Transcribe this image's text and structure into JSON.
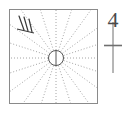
{
  "figure": {
    "canvas": {
      "width": 127,
      "height": 113,
      "background": "#ffffff"
    },
    "colors": {
      "frame": "#8a8a8a",
      "ray": "#9a9a9a",
      "hub": "#555555",
      "hatch": "#3a3a3a",
      "annotation": "#6f6f6f",
      "numeral": "#4a4a4a"
    },
    "frame": {
      "name": "square-border",
      "x": 9.5,
      "y": 9.5,
      "width": 88,
      "height": 94,
      "stroke_width": 1
    },
    "hub": {
      "name": "center-circle",
      "cx": 56,
      "cy": 58,
      "r": 7.5,
      "stroke_width": 1,
      "chord_label": "vertical-diameter",
      "chord": {
        "x1": 56,
        "y1": 50.5,
        "x2": 56,
        "y2": 65.5
      }
    },
    "rays": {
      "name": "radiating-dotted-lines",
      "count": 20,
      "style": "dotted",
      "dash": "1 2",
      "stroke_width": 0.9,
      "angles_deg": [
        0,
        18,
        36,
        54,
        72,
        90,
        108,
        126,
        144,
        162,
        180,
        198,
        216,
        234,
        252,
        270,
        288,
        306,
        324,
        342
      ]
    },
    "hatch_marks": {
      "name": "multiplicity-tick-marks",
      "count": 3,
      "stroke_width": 1.2,
      "strokes": [
        {
          "x1": 19,
          "y1": 16,
          "x2": 24,
          "y2": 30
        },
        {
          "x1": 24,
          "y1": 17,
          "x2": 28,
          "y2": 31
        },
        {
          "x1": 29,
          "y1": 19,
          "x2": 32,
          "y2": 32
        }
      ],
      "base_stroke": {
        "x1": 17,
        "y1": 29,
        "x2": 34,
        "y2": 33
      }
    },
    "annotation": {
      "name": "numeral-with-axis-marker",
      "numeral": "4",
      "numeral_x": 113,
      "numeral_y": 27,
      "numeral_font_size": 22,
      "axis_line": {
        "x1": 113,
        "y1": 22,
        "x2": 113,
        "y2": 73,
        "stroke_width": 1
      },
      "cross_tick": {
        "x1": 104,
        "y1": 45.5,
        "x2": 122,
        "y2": 45.5,
        "stroke_width": 1.6
      }
    }
  }
}
